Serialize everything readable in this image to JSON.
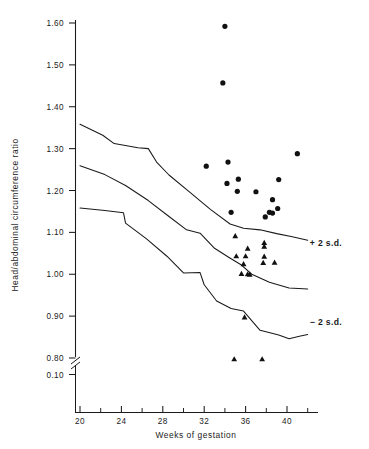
{
  "chart_data": {
    "type": "scatter",
    "title": "",
    "xlabel": "Weeks of gestation",
    "ylabel": "Head/abdominal circumference ratio",
    "xlim": [
      18,
      43
    ],
    "ylim": [
      0.78,
      1.62
    ],
    "grid": false,
    "legend_position": "inline-right",
    "x_ticks_major": [
      20,
      24,
      28,
      32,
      36,
      40
    ],
    "x_tick_labels": [
      "20",
      "24",
      "28",
      "32",
      "36",
      "40"
    ],
    "x_ticks_minor": [
      22,
      26,
      30,
      34,
      38,
      42
    ],
    "y_ticks": [
      1.6,
      1.5,
      1.4,
      1.3,
      1.2,
      1.1,
      1.0,
      0.9,
      0.8
    ],
    "y_tick_labels": [
      "1.60",
      "1.50",
      "1.40",
      "1.30",
      "1.20",
      "1.10",
      "1.00",
      "0.90",
      "0.80"
    ],
    "y_axis_break": true,
    "y_break_label": "0.10",
    "annotations": [
      {
        "text": "+ 2 s.d.",
        "x": 42.2,
        "y": 1.075
      },
      {
        "text": "− 2 s.d.",
        "x": 42.2,
        "y": 0.885
      }
    ],
    "series": [
      {
        "name": "+ 2 s.d.",
        "type": "line",
        "points": [
          {
            "x": 20.0,
            "y": 1.358
          },
          {
            "x": 22.2,
            "y": 1.332
          },
          {
            "x": 23.3,
            "y": 1.312
          },
          {
            "x": 25.6,
            "y": 1.302
          },
          {
            "x": 26.6,
            "y": 1.3
          },
          {
            "x": 27.4,
            "y": 1.268
          },
          {
            "x": 28.6,
            "y": 1.237
          },
          {
            "x": 30.6,
            "y": 1.196
          },
          {
            "x": 32.6,
            "y": 1.155
          },
          {
            "x": 34.5,
            "y": 1.12
          },
          {
            "x": 35.8,
            "y": 1.11
          },
          {
            "x": 37.4,
            "y": 1.106
          },
          {
            "x": 39.0,
            "y": 1.097
          },
          {
            "x": 40.4,
            "y": 1.09
          },
          {
            "x": 42.0,
            "y": 1.081
          }
        ]
      },
      {
        "name": "mean",
        "type": "line",
        "points": [
          {
            "x": 20.0,
            "y": 1.259
          },
          {
            "x": 22.4,
            "y": 1.238
          },
          {
            "x": 24.4,
            "y": 1.212
          },
          {
            "x": 26.6,
            "y": 1.176
          },
          {
            "x": 28.6,
            "y": 1.138
          },
          {
            "x": 30.3,
            "y": 1.106
          },
          {
            "x": 31.6,
            "y": 1.098
          },
          {
            "x": 33.0,
            "y": 1.062
          },
          {
            "x": 34.4,
            "y": 1.04
          },
          {
            "x": 35.6,
            "y": 1.022
          },
          {
            "x": 36.6,
            "y": 1.0
          },
          {
            "x": 38.3,
            "y": 0.981
          },
          {
            "x": 40.2,
            "y": 0.967
          },
          {
            "x": 42.0,
            "y": 0.965
          }
        ]
      },
      {
        "name": "− 2 s.d.",
        "type": "line",
        "points": [
          {
            "x": 20.0,
            "y": 1.158
          },
          {
            "x": 22.4,
            "y": 1.152
          },
          {
            "x": 24.2,
            "y": 1.147
          },
          {
            "x": 24.4,
            "y": 1.122
          },
          {
            "x": 26.4,
            "y": 1.085
          },
          {
            "x": 28.4,
            "y": 1.043
          },
          {
            "x": 30.0,
            "y": 1.003
          },
          {
            "x": 31.6,
            "y": 1.004
          },
          {
            "x": 32.0,
            "y": 0.975
          },
          {
            "x": 33.2,
            "y": 0.936
          },
          {
            "x": 34.6,
            "y": 0.918
          },
          {
            "x": 35.8,
            "y": 0.912
          },
          {
            "x": 37.4,
            "y": 0.866
          },
          {
            "x": 39.2,
            "y": 0.855
          },
          {
            "x": 40.2,
            "y": 0.846
          },
          {
            "x": 41.2,
            "y": 0.852
          },
          {
            "x": 42.0,
            "y": 0.856
          }
        ]
      },
      {
        "name": "circle-group",
        "type": "scatter",
        "marker": "circle",
        "points": [
          {
            "x": 34.0,
            "y": 1.592
          },
          {
            "x": 33.8,
            "y": 1.457
          },
          {
            "x": 41.0,
            "y": 1.288
          },
          {
            "x": 34.3,
            "y": 1.268
          },
          {
            "x": 32.2,
            "y": 1.258
          },
          {
            "x": 35.3,
            "y": 1.227
          },
          {
            "x": 39.2,
            "y": 1.226
          },
          {
            "x": 34.2,
            "y": 1.217
          },
          {
            "x": 35.2,
            "y": 1.198
          },
          {
            "x": 37.0,
            "y": 1.197
          },
          {
            "x": 38.6,
            "y": 1.178
          },
          {
            "x": 39.1,
            "y": 1.157
          },
          {
            "x": 38.3,
            "y": 1.148
          },
          {
            "x": 38.6,
            "y": 1.146
          },
          {
            "x": 34.6,
            "y": 1.148
          },
          {
            "x": 37.9,
            "y": 1.137
          }
        ]
      },
      {
        "name": "triangle-group",
        "type": "scatter",
        "marker": "triangle",
        "points": [
          {
            "x": 35.0,
            "y": 1.091
          },
          {
            "x": 37.8,
            "y": 1.075
          },
          {
            "x": 37.8,
            "y": 1.066
          },
          {
            "x": 36.2,
            "y": 1.061
          },
          {
            "x": 35.1,
            "y": 1.043
          },
          {
            "x": 36.0,
            "y": 1.043
          },
          {
            "x": 37.8,
            "y": 1.042
          },
          {
            "x": 35.8,
            "y": 1.024
          },
          {
            "x": 37.7,
            "y": 1.027
          },
          {
            "x": 38.8,
            "y": 1.028
          },
          {
            "x": 35.6,
            "y": 1.001
          },
          {
            "x": 36.2,
            "y": 1.0
          },
          {
            "x": 36.4,
            "y": 0.999
          },
          {
            "x": 35.9,
            "y": 0.897
          },
          {
            "x": 34.9,
            "y": 0.797
          },
          {
            "x": 37.6,
            "y": 0.797
          }
        ]
      }
    ]
  },
  "axis": {
    "y_title": "Head/abdominal circumference ratio",
    "x_title": "Weeks of gestation"
  }
}
